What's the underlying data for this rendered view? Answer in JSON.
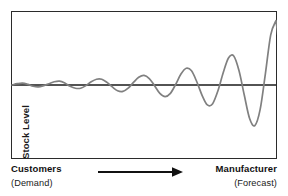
{
  "figure": {
    "name": "bullwhip-effect-diagram",
    "background_color": "#ffffff"
  },
  "plot": {
    "frame_color": "#2b2b2b",
    "axis_line_color": "#1a1a1a",
    "curve_color": "#808080",
    "y_axis_label": "Stock Level"
  },
  "axis_labels": {
    "left_primary": "Customers",
    "left_secondary": "(Demand)",
    "right_primary": "Manufacturer",
    "right_secondary": "(Forecast)"
  },
  "arrow": {
    "name": "direction-arrow",
    "color": "#111111",
    "direction": "left-to-right"
  },
  "chart_data": {
    "type": "line",
    "title": "",
    "xlabel": "",
    "ylabel": "Stock Level",
    "subtitle": "",
    "grid": false,
    "legend": null,
    "xlim": [
      0,
      100
    ],
    "ylim": [
      -1.15,
      1.15
    ],
    "annotations": [
      {
        "text": "Customers",
        "position": "bottom-left"
      },
      {
        "text": "(Demand)",
        "position": "bottom-left"
      },
      {
        "text": "Manufacturer",
        "position": "bottom-right"
      },
      {
        "text": "(Forecast)",
        "position": "bottom-right"
      },
      {
        "text": "arrow pointing from Customers to Manufacturer",
        "position": "bottom-center"
      }
    ],
    "series": [
      {
        "name": "Stock Level",
        "color": "#808080",
        "x": [
          0,
          2,
          4,
          6,
          8,
          10,
          12,
          14,
          16,
          18,
          20,
          22,
          24,
          26,
          28,
          30,
          32,
          34,
          36,
          38,
          40,
          42,
          44,
          46,
          48,
          50,
          52,
          54,
          56,
          58,
          60,
          62,
          64,
          66,
          68,
          70,
          72,
          74,
          76,
          78,
          80,
          82,
          84,
          86,
          88,
          90,
          92,
          94,
          96,
          98,
          100
        ],
        "values": [
          0.0,
          0.02,
          0.03,
          0.01,
          -0.02,
          -0.03,
          -0.01,
          0.02,
          0.05,
          0.06,
          0.03,
          -0.02,
          -0.05,
          -0.05,
          -0.01,
          0.05,
          0.09,
          0.09,
          0.04,
          -0.03,
          -0.09,
          -0.1,
          -0.05,
          0.04,
          0.12,
          0.15,
          0.1,
          -0.01,
          -0.13,
          -0.18,
          -0.13,
          0.01,
          0.17,
          0.26,
          0.22,
          0.05,
          -0.16,
          -0.31,
          -0.29,
          -0.09,
          0.19,
          0.42,
          0.45,
          0.22,
          -0.16,
          -0.52,
          -0.63,
          -0.38,
          0.18,
          0.78,
          1.0
        ]
      }
    ]
  }
}
